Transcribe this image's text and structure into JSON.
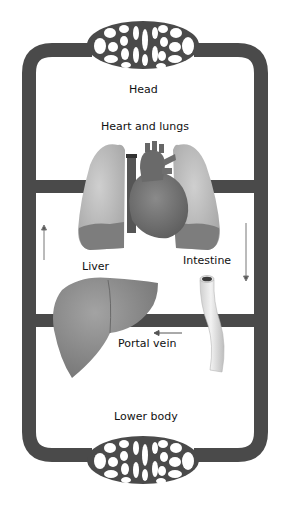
{
  "diagram": {
    "title": "",
    "colors": {
      "vessel": "#4a4a4a",
      "lung": "#b9b9b9",
      "lung_dark": "#7d7d7d",
      "heart": "#7a7a7a",
      "heart_dark": "#5e5e5e",
      "liver": "#8e8e8e",
      "intestine": "#e4e4e4",
      "arrow": "#777777"
    },
    "labels": {
      "head": "Head",
      "heart_lungs": "Heart and lungs",
      "liver": "Liver",
      "intestine": "Intestine",
      "portal_vein": "Portal vein",
      "lower_body": "Lower body"
    },
    "nodes": [
      {
        "id": "head",
        "label": "Head",
        "type": "capillary-bed"
      },
      {
        "id": "heart_lungs",
        "label": "Heart and lungs",
        "type": "organ"
      },
      {
        "id": "liver",
        "label": "Liver",
        "type": "organ"
      },
      {
        "id": "intestine",
        "label": "Intestine",
        "type": "organ"
      },
      {
        "id": "lower_body",
        "label": "Lower body",
        "type": "capillary-bed"
      }
    ],
    "edges": [
      {
        "from": "intestine",
        "to": "liver",
        "label": "Portal vein",
        "direction": "left"
      },
      {
        "from": "liver",
        "to": "heart_lungs",
        "label": "",
        "direction": "up"
      },
      {
        "from": "heart_lungs",
        "to": "intestine",
        "label": "",
        "direction": "down"
      }
    ]
  }
}
